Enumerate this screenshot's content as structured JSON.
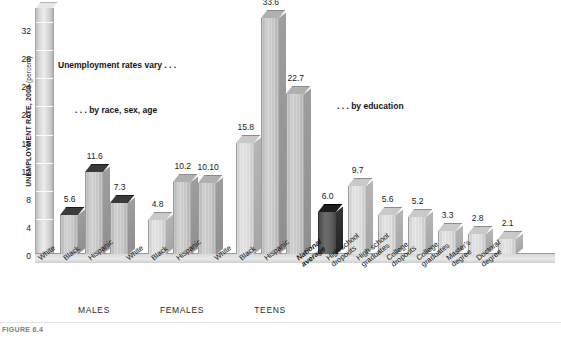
{
  "figure": {
    "caption_label": "FIGURE 6.4"
  },
  "annotations": [
    {
      "id": "anno-vary",
      "text": "Unemployment rates vary . . ."
    },
    {
      "id": "anno-race",
      "text": ". . . by race, sex, age"
    },
    {
      "id": "anno-education",
      "text": ". . . by education"
    }
  ],
  "group_labels": [
    "MALES",
    "FEMALES",
    "TEENS"
  ],
  "chart_data": {
    "type": "bar",
    "title": "",
    "xlabel": "",
    "ylabel": "UNEMPLOYMENT RATE, 2003 (percent)",
    "ylabel_main": "UNEMPLOYMENT RATE, 2003",
    "ylabel_unit": "(percent)",
    "ylim": [
      0,
      34
    ],
    "yticks": [
      0,
      4,
      8,
      12,
      16,
      20,
      24,
      28,
      32
    ],
    "grid": false,
    "legend": "none",
    "categories": [
      "White",
      "Black",
      "Hispanic",
      "White",
      "Black",
      "Hispanic",
      "White",
      "Black",
      "Hispanic",
      "National average",
      "High school dropouts",
      "High school graduates",
      "College dropouts",
      "College graduates",
      "Master's degree",
      "Doctoral degree"
    ],
    "values": [
      5.6,
      11.6,
      7.3,
      4.8,
      10.2,
      10.1,
      15.8,
      33.6,
      22.7,
      6.0,
      9.7,
      5.6,
      5.2,
      3.3,
      2.8,
      2.1
    ],
    "value_labels": [
      "5.6",
      "11.6",
      "7.3",
      "4.8",
      "10.2",
      "10.10",
      "15.8",
      "33.6",
      "22.7",
      "6.0",
      "9.7",
      "5.6",
      "5.2",
      "3.3",
      "2.8",
      "2.1"
    ],
    "groups": [
      {
        "name": "MALES",
        "start": 0,
        "count": 3
      },
      {
        "name": "FEMALES",
        "start": 3,
        "count": 3
      },
      {
        "name": "TEENS",
        "start": 6,
        "count": 3
      }
    ],
    "bar_labels_wrapped": [
      [
        "White"
      ],
      [
        "Black"
      ],
      [
        "Hispanic"
      ],
      [
        "White"
      ],
      [
        "Black"
      ],
      [
        "Hispanic"
      ],
      [
        "White"
      ],
      [
        "Black"
      ],
      [
        "Hispanic"
      ],
      [
        "National",
        "average"
      ],
      [
        "High school",
        "dropouts"
      ],
      [
        "High school",
        "graduates"
      ],
      [
        "College",
        "dropouts"
      ],
      [
        "College",
        "graduates"
      ],
      [
        "Master's",
        "degree"
      ],
      [
        "Doctoral",
        "degree"
      ]
    ],
    "bar_styles": [
      "captop",
      "captop",
      "captop",
      "light",
      "plain",
      "plain",
      "light",
      "plain",
      "plain",
      "dark",
      "light",
      "light",
      "light",
      "light",
      "light",
      "light"
    ],
    "colors": {
      "bar_face": "#c6c6c6",
      "bar_face_light": "#dadada",
      "bar_top_cap": "#3a3a3a",
      "bar_highlight": "#1e1e1e",
      "axis_wall": "#ededed",
      "floor": "#e0e0e0",
      "text": "#1a1a1a",
      "caption": "#7e7e7e"
    }
  }
}
